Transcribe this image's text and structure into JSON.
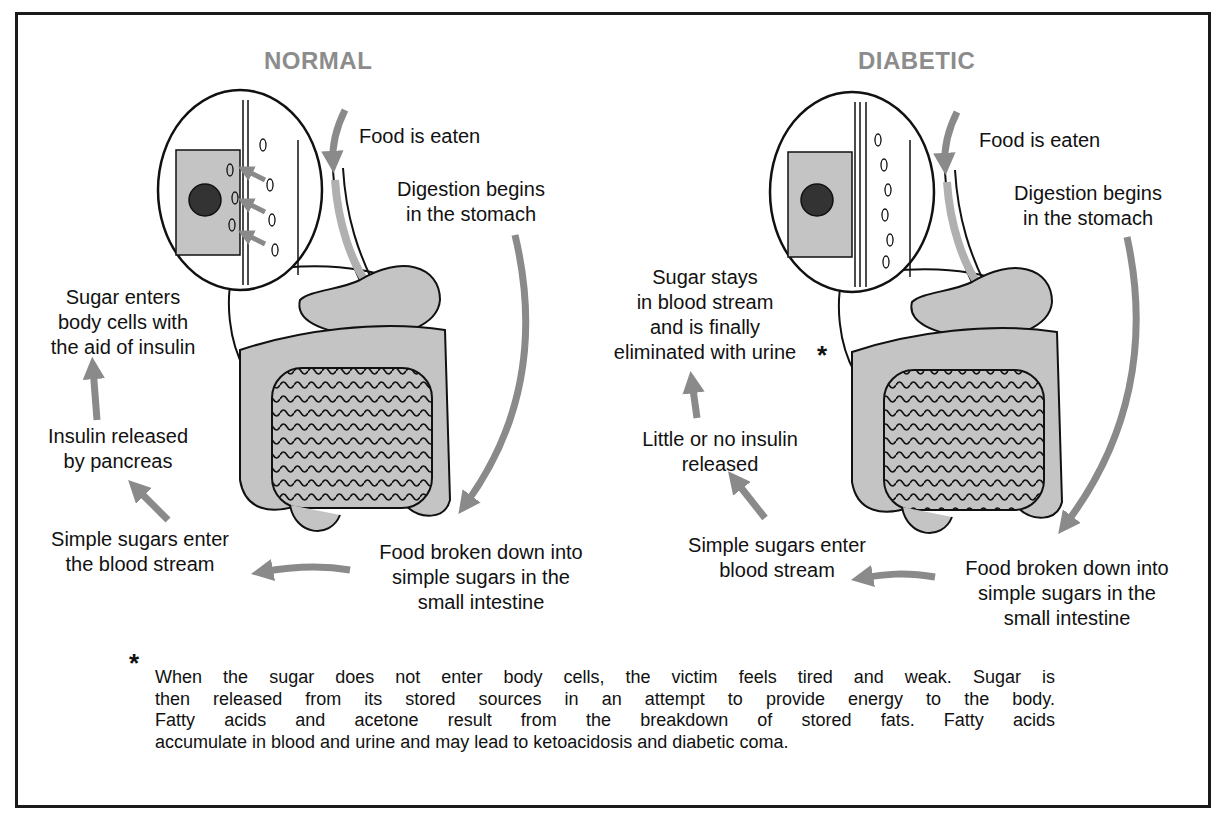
{
  "panels": {
    "normal": {
      "title": "NORMAL",
      "labels": {
        "food_eaten": "Food is eaten",
        "digestion": [
          "Digestion begins",
          "in the stomach"
        ],
        "sugar_enters": [
          "Sugar enters",
          "body cells with",
          "the aid of insulin"
        ],
        "insulin": [
          "Insulin released",
          "by pancreas"
        ],
        "simple_sugars": [
          "Simple sugars enter",
          "the blood stream"
        ],
        "food_broken": [
          "Food broken down into",
          "simple sugars in the",
          "small intestine"
        ]
      }
    },
    "diabetic": {
      "title": "DIABETIC",
      "labels": {
        "food_eaten": "Food is eaten",
        "digestion": [
          "Digestion begins",
          "in the stomach"
        ],
        "sugar_stays": [
          "Sugar stays",
          "in blood stream",
          "and is finally",
          "eliminated with urine"
        ],
        "asterisk": "*",
        "insulin": [
          "Little or no insulin",
          "released"
        ],
        "simple_sugars": [
          "Simple sugars enter",
          "blood stream"
        ],
        "food_broken": [
          "Food broken down into",
          "simple sugars in the",
          "small intestine"
        ]
      }
    }
  },
  "footnote": {
    "marker": "*",
    "lines": [
      "When the sugar does not enter body cells, the victim feels tired and weak. Sugar is",
      "then released from its stored sources in an attempt to provide energy to the body.",
      "Fatty acids and acetone result from the breakdown of stored fats. Fatty acids",
      "accumulate in blood and urine and may lead to ketoacidosis and diabetic coma."
    ]
  },
  "colors": {
    "arrow": "#8a8a8a",
    "organ_fill": "#c4c4c4",
    "title": "#8c8c8c",
    "ink": "#111111"
  }
}
